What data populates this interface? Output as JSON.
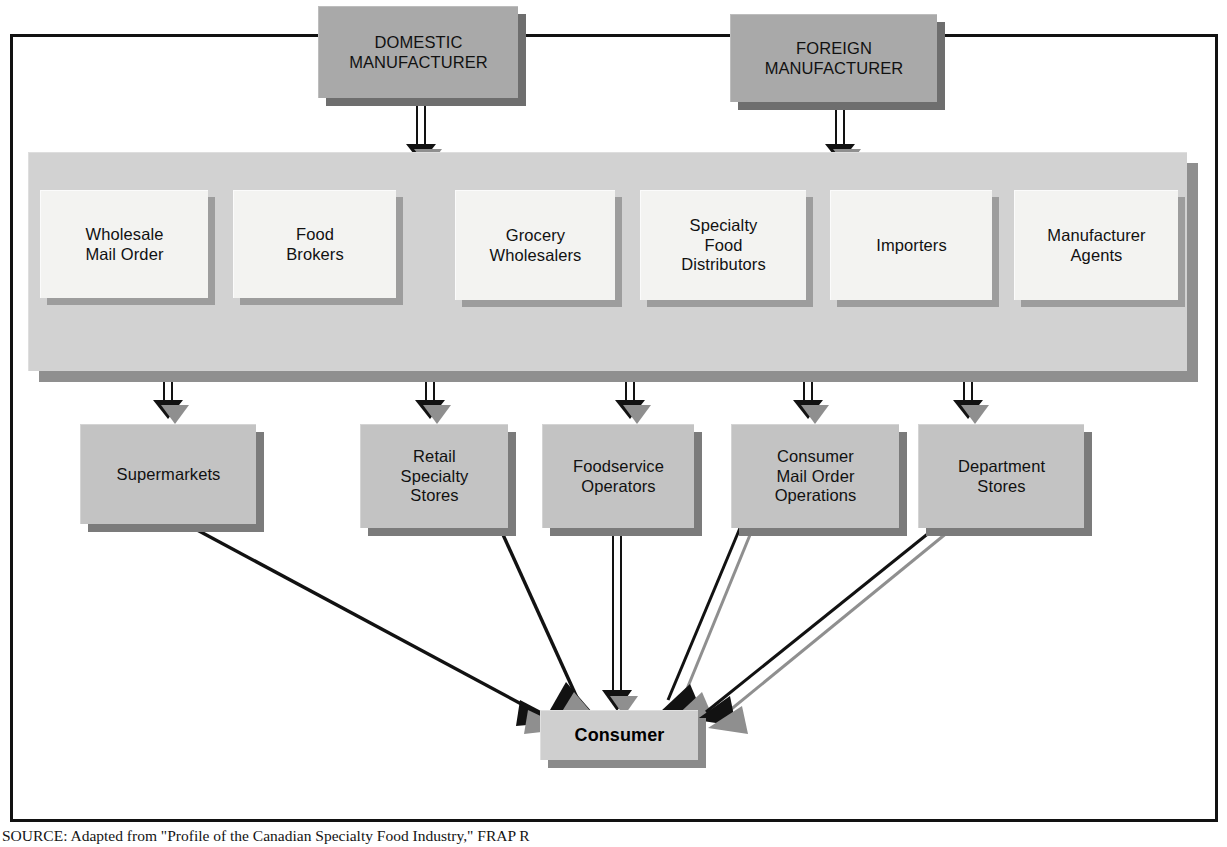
{
  "figure": {
    "caption": "SOURCE: Adapted from \"Profile of the Canadian Specialty Food Industry,\" FRAP R"
  },
  "manufacturers": [
    {
      "id": "domestic-manufacturer",
      "label": "DOMESTIC\nMANUFACTURER"
    },
    {
      "id": "foreign-manufacturer",
      "label": "FOREIGN\nMANUFACTURER"
    }
  ],
  "intermediaries": [
    {
      "id": "wholesale-mail-order",
      "label": "Wholesale\nMail Order"
    },
    {
      "id": "food-brokers",
      "label": "Food\nBrokers"
    },
    {
      "id": "grocery-wholesalers",
      "label": "Grocery\nWholesalers"
    },
    {
      "id": "specialty-food-distributors",
      "label": "Specialty\nFood\nDistributors"
    },
    {
      "id": "importers",
      "label": "Importers"
    },
    {
      "id": "manufacturer-agents",
      "label": "Manufacturer\nAgents"
    }
  ],
  "channels": [
    {
      "id": "supermarkets",
      "label": "Supermarkets"
    },
    {
      "id": "retail-specialty-stores",
      "label": "Retail\nSpecialty\nStores"
    },
    {
      "id": "foodservice-operators",
      "label": "Foodservice\nOperators"
    },
    {
      "id": "consumer-mail-order-operations",
      "label": "Consumer\nMail Order\nOperations"
    },
    {
      "id": "department-stores",
      "label": "Department\nStores"
    }
  ],
  "consumer": {
    "id": "consumer",
    "label": "Consumer"
  },
  "colors": {
    "manufacturer_fill": "#a9a9a9",
    "band_fill": "#d2d2d2",
    "intermediary_fill": "#f3f3f1",
    "channel_fill": "#c3c3c3",
    "consumer_fill": "#cfcfcf",
    "shadow": "#7b7b7b",
    "line": "#121212",
    "line_shadow": "#8f8f8f",
    "frame": "#121212",
    "background": "#ffffff"
  },
  "chart_data": {
    "type": "diagram",
    "nodes": [
      {
        "id": "domestic-manufacturer",
        "label": "DOMESTIC MANUFACTURER",
        "tier": "source"
      },
      {
        "id": "foreign-manufacturer",
        "label": "FOREIGN MANUFACTURER",
        "tier": "source"
      },
      {
        "id": "wholesale-mail-order",
        "label": "Wholesale Mail Order",
        "tier": "intermediary"
      },
      {
        "id": "food-brokers",
        "label": "Food Brokers",
        "tier": "intermediary"
      },
      {
        "id": "grocery-wholesalers",
        "label": "Grocery Wholesalers",
        "tier": "intermediary"
      },
      {
        "id": "specialty-food-distributors",
        "label": "Specialty Food Distributors",
        "tier": "intermediary"
      },
      {
        "id": "importers",
        "label": "Importers",
        "tier": "intermediary"
      },
      {
        "id": "manufacturer-agents",
        "label": "Manufacturer Agents",
        "tier": "intermediary"
      },
      {
        "id": "supermarkets",
        "label": "Supermarkets",
        "tier": "retail"
      },
      {
        "id": "retail-specialty-stores",
        "label": "Retail Specialty Stores",
        "tier": "retail"
      },
      {
        "id": "foodservice-operators",
        "label": "Foodservice Operators",
        "tier": "retail"
      },
      {
        "id": "consumer-mail-order-operations",
        "label": "Consumer Mail Order Operations",
        "tier": "retail"
      },
      {
        "id": "department-stores",
        "label": "Department Stores",
        "tier": "retail"
      },
      {
        "id": "consumer",
        "label": "Consumer",
        "tier": "end"
      }
    ],
    "edges": [
      {
        "from": "domestic-manufacturer",
        "to": "band"
      },
      {
        "from": "foreign-manufacturer",
        "to": "band"
      },
      {
        "from": "food-brokers",
        "to": "grocery-wholesalers"
      },
      {
        "from": "importers",
        "to": "grocery-wholesalers"
      },
      {
        "from": "importers",
        "to": "specialty-food-distributors"
      },
      {
        "from": "manufacturer-agents",
        "to": "grocery-wholesalers"
      },
      {
        "from": "manufacturer-agents",
        "to": "specialty-food-distributors"
      },
      {
        "from": "band",
        "to": "supermarkets"
      },
      {
        "from": "band",
        "to": "retail-specialty-stores"
      },
      {
        "from": "band",
        "to": "foodservice-operators"
      },
      {
        "from": "band",
        "to": "consumer-mail-order-operations"
      },
      {
        "from": "band",
        "to": "department-stores"
      },
      {
        "from": "supermarkets",
        "to": "consumer"
      },
      {
        "from": "retail-specialty-stores",
        "to": "consumer"
      },
      {
        "from": "foodservice-operators",
        "to": "consumer"
      },
      {
        "from": "consumer-mail-order-operations",
        "to": "consumer"
      },
      {
        "from": "department-stores",
        "to": "consumer"
      }
    ]
  }
}
